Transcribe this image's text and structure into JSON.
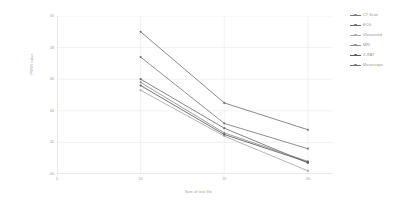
{
  "chart_data": {
    "type": "line",
    "title": "",
    "xlabel": "Size of text file",
    "ylabel": "PSNR value",
    "x": [
      10,
      20,
      30
    ],
    "xlim": [
      0,
      33
    ],
    "ylim": [
      40,
      50
    ],
    "xticks": [
      0,
      10,
      20,
      30
    ],
    "yticks": [
      40,
      42,
      44,
      46,
      48,
      50
    ],
    "grid": true,
    "legend_position": "right",
    "series": [
      {
        "name": "CT Scan",
        "values": [
          47.4,
          43.2,
          41.6
        ],
        "color": "#7b7b7b"
      },
      {
        "name": "ECG",
        "values": [
          46.0,
          42.9,
          40.7
        ],
        "color": "#6f6f6f"
      },
      {
        "name": "Ultrasound",
        "values": [
          45.3,
          42.4,
          40.2
        ],
        "color": "#a8a8a8"
      },
      {
        "name": "MRI",
        "values": [
          45.8,
          42.6,
          40.8
        ],
        "color": "#8d8d8d"
      },
      {
        "name": "X-RAY",
        "values": [
          45.6,
          42.5,
          40.75
        ],
        "color": "#5c5c5c"
      },
      {
        "name": "Microscopic",
        "values": [
          49.0,
          44.5,
          42.8
        ],
        "color": "#747474"
      }
    ]
  },
  "axes": {
    "y_title": "PSNR value",
    "x_title": "Size of text file",
    "y_tick_labels": [
      "50",
      "48",
      "46",
      "44",
      "42",
      "40"
    ],
    "x_tick_labels": [
      "0",
      "10",
      "20",
      "30"
    ]
  },
  "legend": {
    "items": [
      {
        "label": "CT Scan"
      },
      {
        "label": "ECG"
      },
      {
        "label": "Ultrasound"
      },
      {
        "label": "MRI"
      },
      {
        "label": "X-RAY"
      },
      {
        "label": "Microscopic"
      }
    ]
  },
  "style": {
    "axis_color": "#c9c9c9",
    "grid_color": "#e4e4e4",
    "background": "#ffffff"
  }
}
